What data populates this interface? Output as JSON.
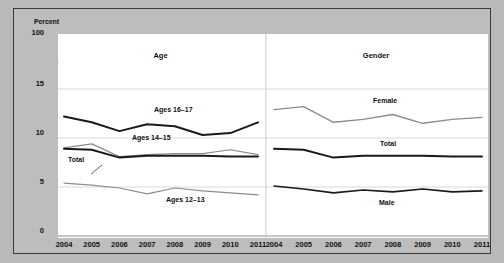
{
  "chart_data": {
    "type": "line",
    "title": "",
    "ylabel": "Percent",
    "xlabel": "",
    "grid": true,
    "legend_position": "inline-labels",
    "axis": {
      "y_ticks": [
        "0",
        "5",
        "10",
        "15",
        "100"
      ],
      "y_break": true,
      "y_break_marker": "//",
      "ylim": [
        0,
        15
      ],
      "x": [
        2004,
        2005,
        2006,
        2007,
        2008,
        2009,
        2010,
        2011
      ],
      "x_tick_labels": [
        "2004",
        "2005",
        "2006",
        "2007",
        "2008",
        "2009",
        "2010",
        "2011"
      ]
    },
    "panels": [
      {
        "name": "age-panel",
        "title": "Age",
        "series": [
          {
            "name": "Ages 16-17",
            "label": "Ages 16–17",
            "color": "#1a1a1a",
            "width": 2.0,
            "values": [
              12.2,
              11.6,
              10.7,
              11.4,
              11.2,
              10.3,
              10.5,
              11.6
            ]
          },
          {
            "name": "Ages 14-15",
            "label": "Ages 14–15",
            "color": "#8c8c8c",
            "width": 1.2,
            "values": [
              9.0,
              9.4,
              8.1,
              8.3,
              8.4,
              8.4,
              8.8,
              8.3
            ]
          },
          {
            "name": "Total",
            "label": "Total",
            "color": "#1a1a1a",
            "width": 2.0,
            "values": [
              8.9,
              8.8,
              8.0,
              8.2,
              8.2,
              8.2,
              8.1,
              8.1
            ]
          },
          {
            "name": "Ages 12-13",
            "label": "Ages 12–13",
            "color": "#8c8c8c",
            "width": 1.2,
            "values": [
              5.4,
              5.2,
              4.9,
              4.3,
              4.9,
              4.6,
              4.4,
              4.2
            ]
          }
        ]
      },
      {
        "name": "gender-panel",
        "title": "Gender",
        "series": [
          {
            "name": "Female",
            "label": "Female",
            "color": "#8c8c8c",
            "width": 1.4,
            "values": [
              12.9,
              13.2,
              11.6,
              11.9,
              12.4,
              11.5,
              11.9,
              12.1
            ]
          },
          {
            "name": "Total",
            "label": "Total",
            "color": "#1a1a1a",
            "width": 2.0,
            "values": [
              8.9,
              8.8,
              8.0,
              8.2,
              8.2,
              8.2,
              8.1,
              8.1
            ]
          },
          {
            "name": "Male",
            "label": "Male",
            "color": "#1a1a1a",
            "width": 1.6,
            "values": [
              5.1,
              4.8,
              4.4,
              4.7,
              4.5,
              4.8,
              4.5,
              4.6
            ]
          }
        ]
      }
    ],
    "colors": {
      "background": "#b9b9b9",
      "plot_background": "#ffffff",
      "gridline": "#d9d9d9",
      "frame_border": "#3a3a3a",
      "dark_series": "#1a1a1a",
      "light_series": "#8c8c8c"
    }
  }
}
